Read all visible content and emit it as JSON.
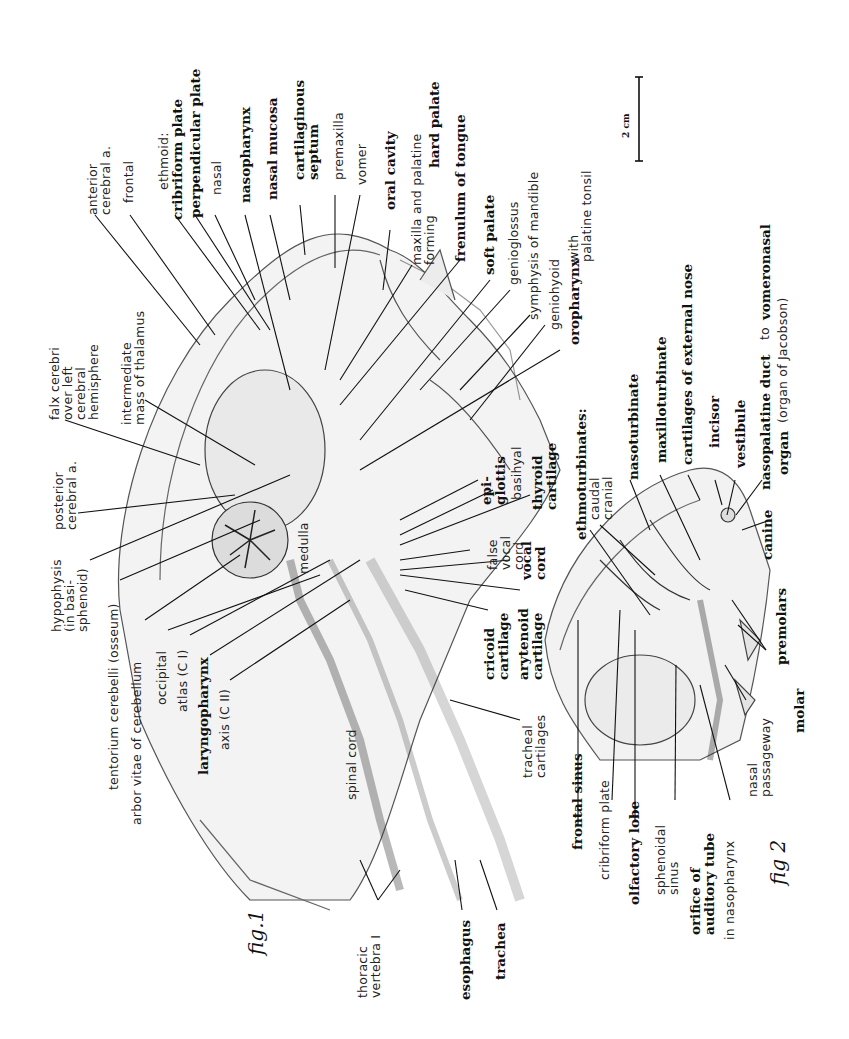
{
  "plate": {
    "orientation": "rotated 90 degrees counter-clockwise",
    "scale_bar": {
      "label": "2 cm"
    },
    "figures": [
      {
        "id": "fig1",
        "caption": "fig.1",
        "labels": [
          {
            "text": "anterior\ncerebral a.",
            "style": "thin"
          },
          {
            "text": "frontal",
            "style": "thin"
          },
          {
            "text": "ethmoid:",
            "style": "thin"
          },
          {
            "text": "cribriform plate",
            "style": "bold"
          },
          {
            "text": "perpendicular plate",
            "style": "bold"
          },
          {
            "text": "nasal",
            "style": "thin"
          },
          {
            "text": "nasopharynx",
            "style": "bold"
          },
          {
            "text": "nasal mucosa",
            "style": "bold"
          },
          {
            "text": "cartilaginous\nseptum",
            "style": "bold"
          },
          {
            "text": "premaxilla",
            "style": "thin"
          },
          {
            "text": "vomer",
            "style": "thin"
          },
          {
            "text": "oral cavity",
            "style": "bold"
          },
          {
            "text": "maxilla and palatine\nforming",
            "style": "thin"
          },
          {
            "text": "hard palate",
            "style": "bold"
          },
          {
            "text": "frenulum of tongue",
            "style": "bold"
          },
          {
            "text": "soft palate",
            "style": "bold"
          },
          {
            "text": "genioglossus",
            "style": "thin"
          },
          {
            "text": "symphysis of mandible",
            "style": "thin"
          },
          {
            "text": "geniohyoid",
            "style": "thin"
          },
          {
            "text": "oropharynx",
            "style": "bold"
          },
          {
            "text": "with\npalatine tonsil",
            "style": "thin"
          },
          {
            "text": "falx cerebri\nover left\ncerebral\nhemisphere",
            "style": "thin"
          },
          {
            "text": "intermediate\nmass of thalamus",
            "style": "thin"
          },
          {
            "text": "posterior\ncerebral a.",
            "style": "thin"
          },
          {
            "text": "hypophysis\n(in basi-\nsphenoid)",
            "style": "thin"
          },
          {
            "text": "tentorium cerebelli (osseum)",
            "style": "thin"
          },
          {
            "text": "arbor vitae of cerebellum",
            "style": "thin"
          },
          {
            "text": "occipital",
            "style": "thin"
          },
          {
            "text": "atlas (C I)",
            "style": "thin"
          },
          {
            "text": "laryngopharynx",
            "style": "bold"
          },
          {
            "text": "axis (C II)",
            "style": "thin"
          },
          {
            "text": "medulla",
            "style": "thin"
          },
          {
            "text": "spinal cord",
            "style": "thin"
          },
          {
            "text": "thoracic\nvertebra I",
            "style": "thin"
          },
          {
            "text": "esophagus",
            "style": "bold"
          },
          {
            "text": "trachea",
            "style": "bold"
          },
          {
            "text": "tracheal\ncartilages",
            "style": "thin"
          },
          {
            "text": "epi-\nglottis",
            "style": "bold"
          },
          {
            "text": "basihyal",
            "style": "thin"
          },
          {
            "text": "thyroid\ncartilage",
            "style": "bold"
          },
          {
            "text": "false\nvocal\ncord",
            "style": "thin"
          },
          {
            "text": "vocal\ncord",
            "style": "bold"
          },
          {
            "text": "cricoid\ncartilage",
            "style": "bold"
          },
          {
            "text": "arytenoid\ncartilage",
            "style": "bold"
          }
        ]
      },
      {
        "id": "fig2",
        "caption": "fig 2",
        "labels": [
          {
            "text": "ethmoturbinates:",
            "style": "bold"
          },
          {
            "text": "caudal\ncranial",
            "style": "thin"
          },
          {
            "text": "nasoturbinate",
            "style": "bold"
          },
          {
            "text": "maxilloturbinate",
            "style": "bold"
          },
          {
            "text": "cartilages of external nose",
            "style": "bold"
          },
          {
            "text": "incisor",
            "style": "bold"
          },
          {
            "text": "vestibule",
            "style": "bold"
          },
          {
            "text": "nasopalatine duct",
            "style": "bold"
          },
          {
            "text": "to",
            "style": "thin"
          },
          {
            "text": "vomeronasal",
            "style": "bold"
          },
          {
            "text": "organ",
            "style": "bold"
          },
          {
            "text": "(organ of Jacobson)",
            "style": "thin"
          },
          {
            "text": "canine",
            "style": "bold"
          },
          {
            "text": "premolars",
            "style": "bold"
          },
          {
            "text": "molar",
            "style": "bold"
          },
          {
            "text": "nasal\npassageway",
            "style": "thin"
          },
          {
            "text": "frontal sinus",
            "style": "bold"
          },
          {
            "text": "cribriform plate",
            "style": "thin"
          },
          {
            "text": "olfactory lobe",
            "style": "bold"
          },
          {
            "text": "sphenoidal\nsinus",
            "style": "thin"
          },
          {
            "text": "orifice of\nauditory tube",
            "style": "bold"
          },
          {
            "text": "in nasopharynx",
            "style": "thin"
          }
        ]
      }
    ]
  }
}
